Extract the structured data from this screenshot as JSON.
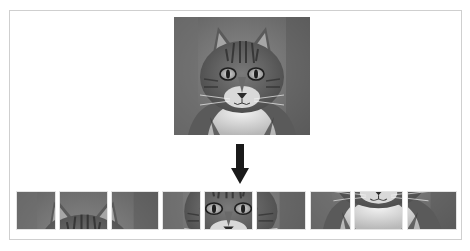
{
  "diagram": {
    "source_image": {
      "label": "cat-face-photo",
      "color_mode": "grayscale",
      "grid": {
        "rows": 3,
        "cols": 3
      }
    },
    "arrow": {
      "direction": "down",
      "color": "#1a1a1a"
    },
    "patches": [
      {
        "index": 1,
        "row": 1,
        "col": 1,
        "content": "background, left ear edge"
      },
      {
        "index": 2,
        "row": 1,
        "col": 2,
        "content": "left ear and forehead fur"
      },
      {
        "index": 3,
        "row": 1,
        "col": 3,
        "content": "right ear"
      },
      {
        "index": 4,
        "row": 2,
        "col": 1,
        "content": "background, left cheek"
      },
      {
        "index": 5,
        "row": 2,
        "col": 2,
        "content": "eyes and nose bridge"
      },
      {
        "index": 6,
        "row": 2,
        "col": 3,
        "content": "right eye, right cheek"
      },
      {
        "index": 7,
        "row": 3,
        "col": 1,
        "content": "background, left whiskers"
      },
      {
        "index": 8,
        "row": 3,
        "col": 2,
        "content": "nose, mouth and white chest"
      },
      {
        "index": 9,
        "row": 3,
        "col": 3,
        "content": "right whiskers, chest"
      }
    ],
    "colors": {
      "frame_border": "#cfcfcf",
      "background": "#ffffff",
      "patch_border": "#e4e4e4"
    }
  }
}
